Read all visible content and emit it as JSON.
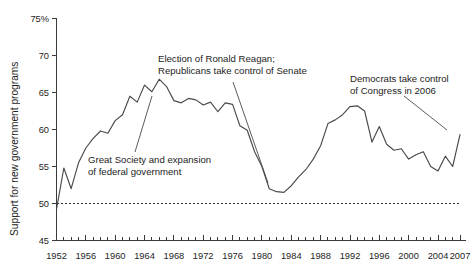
{
  "chart_data": {
    "type": "line",
    "title": "",
    "xlabel": "",
    "ylabel": "Support for new government programs",
    "ylim": [
      45,
      75
    ],
    "xlim": [
      1952,
      2007
    ],
    "grid": false,
    "legend_position": "none",
    "y_ticks": [
      "75%",
      "70",
      "65",
      "60",
      "55",
      "50",
      "45"
    ],
    "y_tick_values": [
      75,
      70,
      65,
      60,
      55,
      50,
      45
    ],
    "x_ticks": [
      "1952",
      "1956",
      "1960",
      "1964",
      "1968",
      "1972",
      "1976",
      "1980",
      "1984",
      "1988",
      "1992",
      "1996",
      "2000",
      "2004",
      "2007"
    ],
    "x_tick_values": [
      1952,
      1956,
      1960,
      1964,
      1968,
      1972,
      1976,
      1980,
      1984,
      1988,
      1992,
      1996,
      2000,
      2004,
      2007
    ],
    "reference_line": {
      "value": 50,
      "style": "dashed",
      "label": ""
    },
    "series": [
      {
        "name": "Support for new government programs",
        "color": "#4a4a4a",
        "x": [
          1952,
          1953,
          1954,
          1955,
          1956,
          1957,
          1958,
          1959,
          1960,
          1961,
          1962,
          1963,
          1964,
          1965,
          1966,
          1967,
          1968,
          1969,
          1970,
          1971,
          1972,
          1973,
          1974,
          1975,
          1976,
          1977,
          1978,
          1979,
          1980,
          1981,
          1982,
          1983,
          1984,
          1985,
          1986,
          1987,
          1988,
          1989,
          1990,
          1991,
          1992,
          1993,
          1994,
          1995,
          1996,
          1997,
          1998,
          1999,
          2000,
          2001,
          2002,
          2003,
          2004,
          2005,
          2006,
          2007
        ],
        "values": [
          49.2,
          54.8,
          52.0,
          55.5,
          57.5,
          58.8,
          59.8,
          59.5,
          61.2,
          62.0,
          64.5,
          63.7,
          66.0,
          65.1,
          66.8,
          65.8,
          63.9,
          63.6,
          64.2,
          64.0,
          63.3,
          63.7,
          62.4,
          63.6,
          63.4,
          60.5,
          59.9,
          57.0,
          55.0,
          52.0,
          51.6,
          51.5,
          52.4,
          53.6,
          54.6,
          56.0,
          57.8,
          60.8,
          61.3,
          62.0,
          63.1,
          63.2,
          62.5,
          58.3,
          60.4,
          58.0,
          57.2,
          57.4,
          56.0,
          56.6,
          57.0,
          55.0,
          54.4,
          56.4,
          55.0,
          59.3
        ]
      }
    ],
    "annotations": [
      {
        "id": "reagan",
        "lines": [
          "Election of Ronald Reagan;",
          "Republicans take control of Senate"
        ],
        "points_to_year": 1980,
        "points_to_value": 52.0
      },
      {
        "id": "great-society",
        "lines": [
          "Great Society and expansion",
          "of federal government"
        ],
        "points_to_year": 1965,
        "points_to_value": 65.1
      },
      {
        "id": "democrats-2006",
        "lines": [
          "Democrats take control",
          "of Congress in 2006"
        ],
        "points_to_year": 2006,
        "points_to_value": 55.0
      }
    ]
  },
  "axes": {
    "y_axis_title": "Support for new government programs"
  }
}
